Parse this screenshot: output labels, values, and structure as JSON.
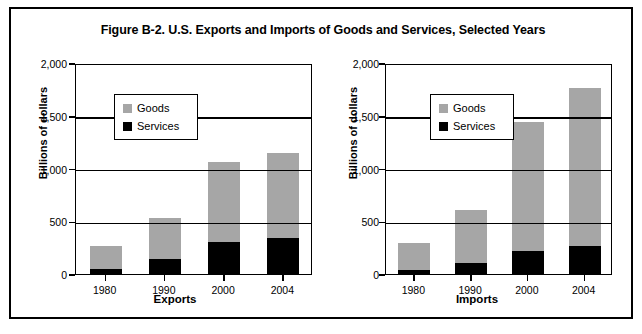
{
  "figure": {
    "title": "Figure B-2. U.S. Exports and Imports of Goods and Services, Selected Years"
  },
  "legend": {
    "goods_label": "Goods",
    "services_label": "Services",
    "goods_color": "#a6a6a6",
    "services_color": "#000000"
  },
  "axes": {
    "y_title": "Billions of dollars",
    "y_ticks": [
      "2,000",
      "1,500",
      "1,000",
      "500",
      "0"
    ],
    "x_title_left": "Exports",
    "x_title_right": "Imports",
    "x_ticks": [
      "1980",
      "1990",
      "2000",
      "2004"
    ]
  },
  "chart_data": [
    {
      "type": "bar",
      "stacked": true,
      "title": "Figure B-2. U.S. Exports and Imports of Goods and Services, Selected Years",
      "subtitle": "Exports",
      "xlabel": "Exports",
      "ylabel": "Billions of dollars",
      "ylim": [
        0,
        2000
      ],
      "yticks": [
        0,
        500,
        1000,
        1500,
        2000
      ],
      "ytick_labels": [
        "0",
        "500",
        "1,000",
        "1,500",
        "2,000"
      ],
      "grid": "horizontal",
      "legend_position": "upper-left-inside",
      "categories": [
        "1980",
        "1990",
        "2000",
        "2004"
      ],
      "series": [
        {
          "name": "Services",
          "color": "#000000",
          "values": [
            48,
            145,
            300,
            340
          ]
        },
        {
          "name": "Goods",
          "color": "#a6a6a6",
          "values": [
            222,
            390,
            760,
            805
          ]
        }
      ],
      "totals": [
        270,
        535,
        1060,
        1145
      ]
    },
    {
      "type": "bar",
      "stacked": true,
      "title": "Figure B-2. U.S. Exports and Imports of Goods and Services, Selected Years",
      "subtitle": "Imports",
      "xlabel": "Imports",
      "ylabel": "Billions of dollars",
      "ylim": [
        0,
        2000
      ],
      "yticks": [
        0,
        500,
        1000,
        1500,
        2000
      ],
      "ytick_labels": [
        "0",
        "500",
        "1,000",
        "1,500",
        "2,000"
      ],
      "grid": "horizontal",
      "legend_position": "upper-left-inside",
      "categories": [
        "1980",
        "1990",
        "2000",
        "2004"
      ],
      "series": [
        {
          "name": "Services",
          "color": "#000000",
          "values": [
            40,
            105,
            215,
            270
          ]
        },
        {
          "name": "Goods",
          "color": "#a6a6a6",
          "values": [
            250,
            500,
            1230,
            1490
          ]
        }
      ],
      "totals": [
        290,
        605,
        1445,
        1760
      ]
    }
  ]
}
